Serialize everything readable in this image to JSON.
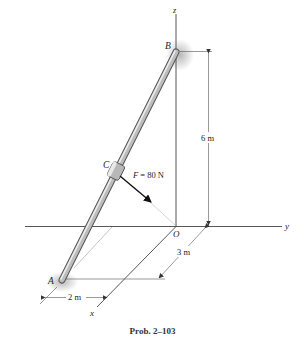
{
  "figure": {
    "caption": "Prob. 2–103",
    "axes": {
      "x": "x",
      "y": "y",
      "z": "z",
      "origin": "O"
    },
    "points": {
      "A": "A",
      "B": "B",
      "C": "C"
    },
    "force": {
      "label": "F = 80 N",
      "symbol": "F",
      "value": "= 80 N"
    },
    "dimensions": {
      "height": "6 m",
      "depth": "3 m",
      "width": "2 m"
    },
    "colors": {
      "rod": "#9a9a9a",
      "rod_highlight": "#e6e6e6",
      "line": "#333333",
      "thin_line": "#999999"
    }
  }
}
